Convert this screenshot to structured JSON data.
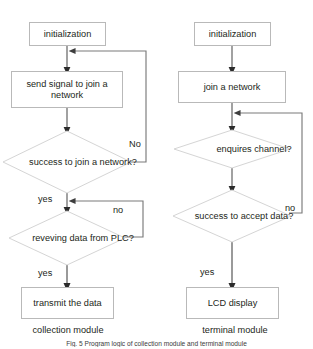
{
  "figure": {
    "caption": "Fig. 5  Program logic of collection module and terminal module",
    "caption_top": 340
  },
  "diagram": {
    "type": "flowchart",
    "columns": [
      {
        "id": "collection",
        "module_label": "collection module",
        "nodes": [
          {
            "id": "l1",
            "shape": "process",
            "text": "initialization"
          },
          {
            "id": "l2",
            "shape": "process",
            "text": "send signal to join a network"
          },
          {
            "id": "l3",
            "shape": "decision",
            "text": "success to join a network?"
          },
          {
            "id": "l4",
            "shape": "decision",
            "text": "reveving data from PLC?"
          },
          {
            "id": "l5",
            "shape": "process",
            "text": "transmit the data"
          }
        ],
        "edge_labels": [
          {
            "id": "l3-no",
            "text": "No"
          },
          {
            "id": "l3-yes",
            "text": "yes"
          },
          {
            "id": "l4-no",
            "text": "no"
          },
          {
            "id": "l4-yes",
            "text": "yes"
          }
        ]
      },
      {
        "id": "terminal",
        "module_label": "terminal module",
        "nodes": [
          {
            "id": "r1",
            "shape": "process",
            "text": "initialization"
          },
          {
            "id": "r2",
            "shape": "process",
            "text": "join a network"
          },
          {
            "id": "r3",
            "shape": "decision",
            "text": "enquires channel?"
          },
          {
            "id": "r4",
            "shape": "decision",
            "text": "success to accept data?"
          },
          {
            "id": "r5",
            "shape": "process",
            "text": "LCD display"
          }
        ],
        "edge_labels": [
          {
            "id": "r4-no",
            "text": "no"
          },
          {
            "id": "r4-yes",
            "text": "yes"
          }
        ]
      }
    ]
  },
  "colors": {
    "box_border": "#b9b9b9",
    "diamond_border": "#d3d3d3",
    "connector": "#4a4a4a",
    "text": "#231f20",
    "background": "#ffffff"
  }
}
